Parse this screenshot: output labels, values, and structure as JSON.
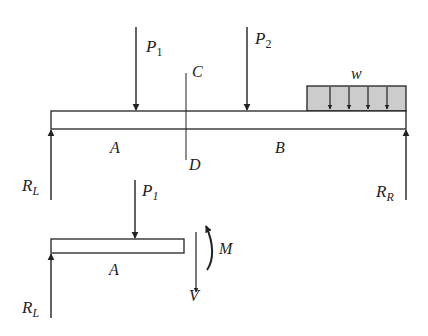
{
  "diagram": {
    "colors": {
      "line": "#222222",
      "load_fill": "#cccccc",
      "background": "#ffffff"
    },
    "full_beam": {
      "loads": {
        "p1": {
          "symbol": "P",
          "subscript": "1"
        },
        "p2": {
          "symbol": "P",
          "subscript": "2"
        },
        "distributed": {
          "symbol": "w"
        }
      },
      "section": {
        "top_label": "C",
        "bottom_label": "D"
      },
      "segments": {
        "left": "A",
        "right": "B"
      },
      "reactions": {
        "left": {
          "symbol": "R",
          "subscript": "L"
        },
        "right": {
          "symbol": "R",
          "subscript": "R"
        }
      }
    },
    "free_body": {
      "load": {
        "symbol": "P",
        "subscript": "1"
      },
      "segment": "A",
      "reaction": {
        "symbol": "R",
        "subscript": "L"
      },
      "internal": {
        "moment": "M",
        "shear": "V"
      }
    }
  }
}
